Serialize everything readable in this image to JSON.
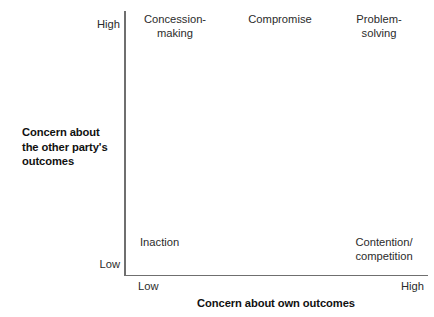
{
  "figure": {
    "type": "dual-concern-conflict-style-grid",
    "background_color": "#ffffff",
    "line_color": "#6f6f6f",
    "text_color": "#2b2b2b"
  },
  "axes": {
    "y": {
      "title": "Concern about\nthe other party's\noutcomes",
      "high_label": "High",
      "low_label": "Low"
    },
    "x": {
      "title": "Concern about own outcomes",
      "low_label": "Low",
      "high_label": "High"
    }
  },
  "chart_data": {
    "type": "scatter",
    "title": "",
    "xlabel": "Concern about own outcomes",
    "ylabel": "Concern about the other party's outcomes",
    "xlim": [
      "Low",
      "High"
    ],
    "ylim": [
      "Low",
      "High"
    ],
    "grid": false,
    "legend": "none",
    "annotations": [
      {
        "label": "Concession-\nmaking",
        "x": "Low",
        "y": "High",
        "align": "center"
      },
      {
        "label": "Compromise",
        "x": "Medium",
        "y": "High",
        "align": "center"
      },
      {
        "label": "Problem-\nsolving",
        "x": "High",
        "y": "High",
        "align": "center"
      },
      {
        "label": "Inaction",
        "x": "Low",
        "y": "Low",
        "align": "left"
      },
      {
        "label": "Contention/\ncompetition",
        "x": "High",
        "y": "Low",
        "align": "center"
      }
    ]
  },
  "cells": {
    "concession": "Concession-\nmaking",
    "compromise": "Compromise",
    "problem_solving": "Problem-\nsolving",
    "inaction": "Inaction",
    "contention": "Contention/\ncompetition"
  }
}
